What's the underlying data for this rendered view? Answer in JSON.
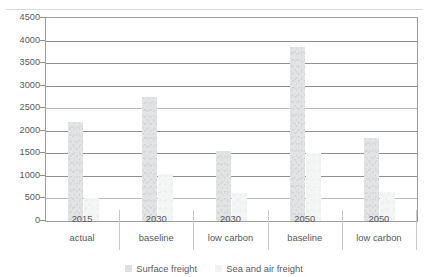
{
  "chart_data": {
    "type": "bar",
    "title": "Figure 4.2: Freight demand in the low carbon scenario",
    "xlabel": "",
    "ylabel": "",
    "ylim": [
      0,
      4500
    ],
    "ytick_step": 500,
    "yticks": [
      "4500",
      "4000",
      "3500",
      "3000",
      "2500",
      "2000",
      "1500",
      "1000",
      "500",
      "0"
    ],
    "grid": true,
    "legend_position": "bottom",
    "categories": [
      {
        "year": "2015",
        "scenario": "actual"
      },
      {
        "year": "2030",
        "scenario": "baseline"
      },
      {
        "year": "2030",
        "scenario": "low carbon"
      },
      {
        "year": "2050",
        "scenario": "baseline"
      },
      {
        "year": "2050",
        "scenario": "low carbon"
      }
    ],
    "series": [
      {
        "name": "Surface freight",
        "color": "#e2e3e4",
        "values": [
          2200,
          2750,
          1550,
          3850,
          1850
        ]
      },
      {
        "name": "Sea and air freight",
        "color": "#f4f5f5",
        "values": [
          520,
          1050,
          620,
          1500,
          640
        ]
      }
    ]
  }
}
